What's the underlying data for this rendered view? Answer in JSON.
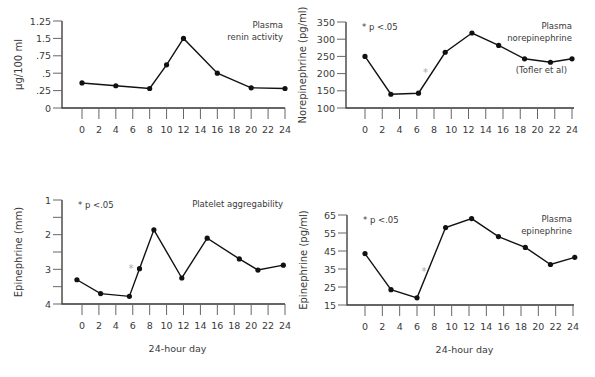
{
  "chart_data": [
    {
      "type": "line",
      "id": "renin",
      "title": "Plasma renin activity",
      "title_lines": [
        "Plasma",
        "renin activity"
      ],
      "ylabel": "µg/100 ml",
      "xlabel": "",
      "x_ticks": [
        0,
        2,
        4,
        6,
        8,
        10,
        12,
        14,
        16,
        18,
        20,
        22,
        24
      ],
      "y_tick_labels": [
        "0",
        ".25",
        ".5",
        ".75",
        "1.5",
        "1.25"
      ],
      "y_tick_positions": [
        0,
        0.25,
        0.5,
        0.75,
        1.0,
        1.25
      ],
      "ylim": [
        0,
        1.25
      ],
      "series": [
        {
          "name": "Plasma renin activity",
          "x": [
            0,
            4,
            8,
            10,
            12,
            16,
            20,
            24
          ],
          "values": [
            0.36,
            0.32,
            0.28,
            0.62,
            1.0,
            0.5,
            0.29,
            0.28
          ]
        }
      ],
      "notes": [],
      "significance_marker": null,
      "frame": {
        "ox": 62,
        "oy": 108,
        "x0": 82,
        "x24": 285,
        "ytop": 21,
        "xend": 285
      }
    },
    {
      "type": "line",
      "id": "norepinephrine",
      "title": "Plasma norepinephrine",
      "title_lines": [
        "Plasma",
        "norepinephrine"
      ],
      "source": "(Tofler et al)",
      "ylabel": "Norepinephrine (pg/ml)",
      "xlabel": "",
      "x_ticks": [
        0,
        2,
        4,
        6,
        8,
        10,
        12,
        14,
        16,
        18,
        20,
        22,
        24
      ],
      "y_tick_labels": [
        "100",
        "150",
        "200",
        "250",
        "300",
        "350"
      ],
      "y_tick_positions": [
        100,
        150,
        200,
        250,
        300,
        350
      ],
      "ylim": [
        100,
        350
      ],
      "series": [
        {
          "name": "Plasma norepinephrine",
          "x": [
            0,
            3,
            6.2,
            9.3,
            12.4,
            15.5,
            18.5,
            21.5,
            24
          ],
          "values": [
            250,
            140,
            143,
            262,
            318,
            282,
            243,
            233,
            243
          ]
        }
      ],
      "notes": [
        "* p <.05"
      ],
      "significance_marker": {
        "x": 7,
        "y": 205
      },
      "frame": {
        "ox": 346,
        "oy": 108,
        "x0": 365,
        "x24": 572,
        "ytop": 22,
        "xend": 574
      }
    },
    {
      "type": "line",
      "id": "platelet",
      "title": "Platelet aggregability",
      "title_lines": [
        "Platelet aggregability"
      ],
      "ylabel": "Epinephrine (mm)",
      "xlabel": "24-hour day",
      "x_ticks": [
        0,
        2,
        4,
        6,
        8,
        10,
        12,
        14,
        16,
        18,
        20,
        22,
        24
      ],
      "y_tick_labels": [
        "1",
        "",
        "2",
        "",
        "3",
        "",
        "4"
      ],
      "y_tick_positions": [
        1,
        1.5,
        2,
        2.5,
        3,
        3.5,
        4
      ],
      "ylim": [
        4,
        1
      ],
      "y_inverted": true,
      "series": [
        {
          "name": "Platelet aggregability",
          "x": [
            -0.6,
            2.2,
            5.6,
            6.8,
            8.5,
            11.8,
            14.8,
            18.6,
            20.8,
            23.8
          ],
          "values": [
            3.3,
            3.7,
            3.78,
            2.98,
            1.86,
            3.25,
            2.1,
            2.7,
            3.02,
            2.88
          ]
        }
      ],
      "notes": [
        "* p <.05"
      ],
      "significance_marker": {
        "x": 5.8,
        "y": 2.95
      },
      "frame": {
        "ox": 62,
        "oy": 304,
        "x0": 82,
        "x24": 285,
        "ytop": 200,
        "xend": 285
      }
    },
    {
      "type": "line",
      "id": "epinephrine",
      "title": "Plasma epinephrine",
      "title_lines": [
        "Plasma",
        "epinephrine"
      ],
      "ylabel": "Epinephrine (pg/ml)",
      "xlabel": "24-hour day",
      "x_ticks": [
        0,
        2,
        4,
        6,
        8,
        10,
        12,
        14,
        16,
        18,
        20,
        22,
        24
      ],
      "y_tick_labels": [
        "15",
        "25",
        "35",
        "45",
        "55",
        "65"
      ],
      "y_tick_positions": [
        15,
        25,
        35,
        45,
        55,
        65
      ],
      "ylim": [
        15,
        65
      ],
      "series": [
        {
          "name": "Plasma epinephrine",
          "x": [
            0,
            3,
            6,
            9.3,
            12.3,
            15.4,
            18.5,
            21.4,
            24.2
          ],
          "values": [
            43.5,
            23.5,
            19,
            58,
            63,
            53,
            47,
            37.5,
            41.5
          ]
        }
      ],
      "notes": [
        "* p <.05"
      ],
      "significance_marker": {
        "x": 6.8,
        "y": 34
      },
      "frame": {
        "ox": 347,
        "oy": 305,
        "x0": 365,
        "x24": 573,
        "ytop": 215,
        "xend": 574
      }
    }
  ]
}
